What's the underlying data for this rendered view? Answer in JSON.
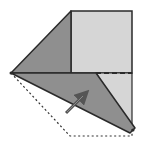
{
  "diagram": {
    "type": "origami-fold-step",
    "colors": {
      "dark_face": "#8f8f8f",
      "light_face": "#d6d6d6",
      "outline": "#2a2a2a",
      "arrow": "#555555",
      "background": "#ffffff"
    },
    "shapes": {
      "square_back": "71,11 132,11 132,73 71,73",
      "left_flap": "11,73 71,11 71,73",
      "right_light_strip": "96,73 132,73 132,128",
      "folded_flap": "11,73 96,73 135,128 130,133"
    },
    "lines": {
      "dashed_crease": {
        "x1": 96,
        "y1": 73,
        "x2": 132,
        "y2": 73
      },
      "dotted_outline": "11,73 70,136 132,136 132,128"
    },
    "arrow": {
      "x1": 66,
      "y1": 113,
      "x2": 86,
      "y2": 93,
      "direction": "unfold-up-right"
    }
  }
}
